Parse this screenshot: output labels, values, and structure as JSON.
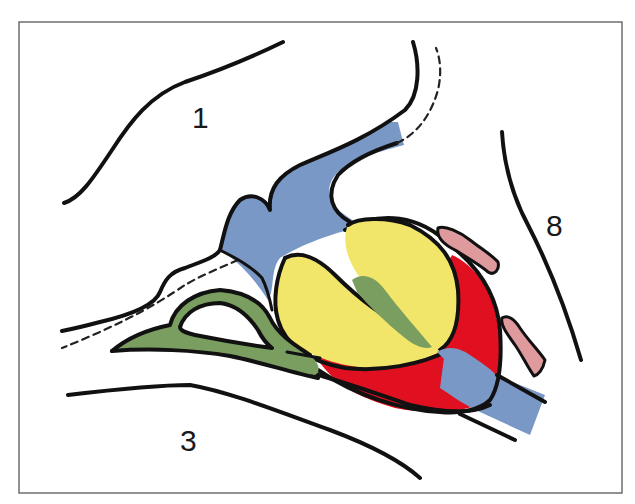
{
  "diagram": {
    "type": "anatomical-cross-section",
    "labels": [
      {
        "id": "label-1",
        "text": "1",
        "x": 192,
        "y": 128
      },
      {
        "id": "label-3",
        "text": "3",
        "x": 180,
        "y": 451
      },
      {
        "id": "label-8",
        "text": "8",
        "x": 546,
        "y": 236
      }
    ],
    "colors": {
      "blue": "#7a98c6",
      "yellow": "#f2e66a",
      "green": "#7a9e60",
      "red": "#e01020",
      "pink": "#de9a9c",
      "outline": "#111111",
      "frame": "#6e6e6e"
    },
    "regions": [
      {
        "name": "blue-structure",
        "color_key": "blue"
      },
      {
        "name": "yellow-lobe-upper",
        "color_key": "yellow"
      },
      {
        "name": "yellow-lobe-lower",
        "color_key": "yellow"
      },
      {
        "name": "green-band",
        "color_key": "green"
      },
      {
        "name": "red-capsule",
        "color_key": "red"
      },
      {
        "name": "pink-strip-upper",
        "color_key": "pink"
      },
      {
        "name": "pink-strip-lower",
        "color_key": "pink"
      }
    ]
  }
}
